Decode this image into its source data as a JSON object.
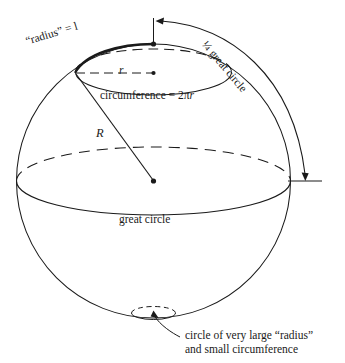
{
  "figure": {
    "colors": {
      "ink": "#1a1a1a",
      "background": "#ffffff"
    },
    "labels": {
      "radius_l": "“radius” = l",
      "quarter_great_circle": "¼ great circle",
      "r": "r",
      "circumference": "circumference = 2πr",
      "circumference_prefix": "circumference = 2",
      "circumference_pi": "π",
      "circumference_r": "r",
      "R": "R",
      "great_circle": "great circle",
      "small_circle_line1": "circle of very large “radius”",
      "small_circle_line2": "and small circumference"
    },
    "geometry": {
      "sphere_center_x": 153.5,
      "sphere_center_y": 181,
      "sphere_radius": 137,
      "north_pole_x": 153.5,
      "north_pole_y": 44,
      "south_pole_x": 153.5,
      "south_pole_y": 318,
      "small_circle_top_ry": 23,
      "small_circle_top_cy": 72,
      "small_circle_top_rx": 78,
      "great_circle_ry": 34,
      "bottom_circle_rx": 22,
      "bottom_circle_ry": 6
    }
  }
}
